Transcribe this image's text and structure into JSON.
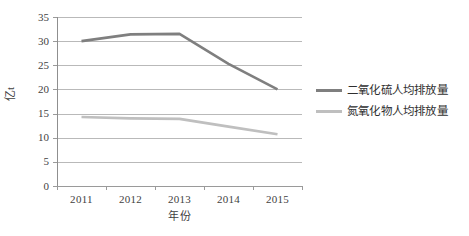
{
  "chart_data": {
    "type": "line",
    "title": "",
    "xlabel": "年份",
    "ylabel": "亿t",
    "categories": [
      "2011",
      "2012",
      "2013",
      "2014",
      "2015"
    ],
    "series": [
      {
        "name": "二氧化硫人均排放量",
        "color": "#7f7f7f",
        "values": [
          30.0,
          31.4,
          31.5,
          25.3,
          20.0
        ]
      },
      {
        "name": "氮氧化物人均排放量",
        "color": "#bfbfbf",
        "values": [
          14.3,
          14.0,
          13.9,
          12.3,
          10.7
        ]
      }
    ],
    "ylim": [
      0,
      35
    ],
    "yticks": [
      "0",
      "5",
      "10",
      "15",
      "20",
      "25",
      "30",
      "35"
    ],
    "grid": true,
    "legend_position": "right"
  },
  "axes": {
    "y_title": "亿t",
    "x_title": "年份",
    "y_ticks": [
      "35",
      "30",
      "25",
      "20",
      "15",
      "10",
      "5",
      "0"
    ],
    "x_ticks": [
      "2011",
      "2012",
      "2013",
      "2014",
      "2015"
    ]
  },
  "legend": {
    "items": [
      {
        "label": "二氧化硫人均排放量",
        "color": "#7f7f7f"
      },
      {
        "label": "氮氧化物人均排放量",
        "color": "#bfbfbf"
      }
    ]
  }
}
